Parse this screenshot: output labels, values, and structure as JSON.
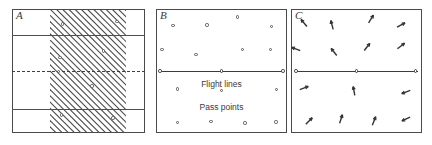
{
  "figure": {
    "background_color": "#ffffff",
    "ink_color": "#3c3c3c",
    "width": 432,
    "height": 145
  },
  "panels": [
    {
      "id": "A",
      "label": "A",
      "x": 12,
      "y": 9,
      "width": 133,
      "height": 124,
      "description": "Flight strips with dashed center line and diagonal hatched overlap band",
      "flight_strip_lines": [
        {
          "y_pct": 21.0
        },
        {
          "y_pct": 80.5
        }
      ],
      "center_dashed_line": {
        "y_pct": 50.0
      },
      "hatch_band": {
        "x_pct": 28.5,
        "width_pct": 57.0,
        "y_pct": 0.0,
        "height_pct": 100.0,
        "angle_deg": 45,
        "spacing_px": 6.2,
        "stroke_color": "#4a4a4a"
      },
      "markers": [
        {
          "x_pct": 38.0,
          "y_pct": 12.0
        },
        {
          "x_pct": 79.0,
          "y_pct": 10.0
        },
        {
          "x_pct": 69.0,
          "y_pct": 34.0
        },
        {
          "x_pct": 36.0,
          "y_pct": 39.0
        },
        {
          "x_pct": 35.0,
          "y_pct": 50.5
        },
        {
          "x_pct": 60.0,
          "y_pct": 62.0
        },
        {
          "x_pct": 37.0,
          "y_pct": 85.5
        },
        {
          "x_pct": 76.0,
          "y_pct": 88.0
        }
      ]
    },
    {
      "id": "B",
      "label": "B",
      "x": 156,
      "y": 9,
      "width": 131,
      "height": 124,
      "description": "Pass points distribution with a single flight line",
      "flight_line": {
        "y_pct": 50.0,
        "x_start_pct": 2.0,
        "x_end_pct": 98.0,
        "nodes_x_pct": [
          3.0,
          50.0,
          97.0
        ]
      },
      "captions": [
        {
          "text": "Flight lines",
          "x_pct": 50.0,
          "y_pct": 57.0
        },
        {
          "text": "Pass points",
          "x_pct": 50.0,
          "y_pct": 76.0
        }
      ],
      "pass_points": [
        {
          "x_pct": 62.0,
          "y_pct": 6.5
        },
        {
          "x_pct": 13.0,
          "y_pct": 13.5
        },
        {
          "x_pct": 39.0,
          "y_pct": 13.0
        },
        {
          "x_pct": 88.0,
          "y_pct": 14.0
        },
        {
          "x_pct": 4.5,
          "y_pct": 32.5
        },
        {
          "x_pct": 30.5,
          "y_pct": 36.5
        },
        {
          "x_pct": 66.0,
          "y_pct": 32.5
        },
        {
          "x_pct": 87.5,
          "y_pct": 32.5
        },
        {
          "x_pct": 16.5,
          "y_pct": 64.5
        },
        {
          "x_pct": 50.0,
          "y_pct": 65.5
        },
        {
          "x_pct": 92.0,
          "y_pct": 65.0
        },
        {
          "x_pct": 16.5,
          "y_pct": 91.5
        },
        {
          "x_pct": 42.0,
          "y_pct": 90.5
        },
        {
          "x_pct": 68.0,
          "y_pct": 92.0
        },
        {
          "x_pct": 91.5,
          "y_pct": 91.0
        }
      ]
    },
    {
      "id": "C",
      "label": "C",
      "x": 291,
      "y": 9,
      "width": 131,
      "height": 124,
      "description": "Residual displacement vectors at pass point locations with flight line",
      "flight_line": {
        "y_pct": 50.0,
        "x_start_pct": 3.0,
        "x_end_pct": 97.0,
        "nodes_x_pct": [
          4.0,
          50.0,
          95.0
        ]
      },
      "vectors": [
        {
          "x_pct": 10.0,
          "y_pct": 11.0,
          "angle_deg": 130,
          "length_px": 9
        },
        {
          "x_pct": 31.0,
          "y_pct": 12.5,
          "angle_deg": 105,
          "length_px": 9
        },
        {
          "x_pct": 61.0,
          "y_pct": 8.0,
          "angle_deg": 58,
          "length_px": 9
        },
        {
          "x_pct": 84.0,
          "y_pct": 13.0,
          "angle_deg": 28,
          "length_px": 9
        },
        {
          "x_pct": 4.0,
          "y_pct": 32.0,
          "angle_deg": 160,
          "length_px": 9
        },
        {
          "x_pct": 33.0,
          "y_pct": 34.5,
          "angle_deg": 128,
          "length_px": 9
        },
        {
          "x_pct": 58.0,
          "y_pct": 31.0,
          "angle_deg": 52,
          "length_px": 9
        },
        {
          "x_pct": 84.0,
          "y_pct": 30.0,
          "angle_deg": 38,
          "length_px": 9
        },
        {
          "x_pct": 10.0,
          "y_pct": 64.0,
          "angle_deg": 20,
          "length_px": 9
        },
        {
          "x_pct": 48.0,
          "y_pct": 66.0,
          "angle_deg": 100,
          "length_px": 9
        },
        {
          "x_pct": 88.0,
          "y_pct": 67.0,
          "angle_deg": 200,
          "length_px": 9
        },
        {
          "x_pct": 14.0,
          "y_pct": 90.0,
          "angle_deg": 45,
          "length_px": 9
        },
        {
          "x_pct": 38.0,
          "y_pct": 89.0,
          "angle_deg": 72,
          "length_px": 9
        },
        {
          "x_pct": 63.0,
          "y_pct": 90.0,
          "angle_deg": 68,
          "length_px": 9
        },
        {
          "x_pct": 88.0,
          "y_pct": 89.0,
          "angle_deg": 205,
          "length_px": 9
        }
      ]
    }
  ]
}
